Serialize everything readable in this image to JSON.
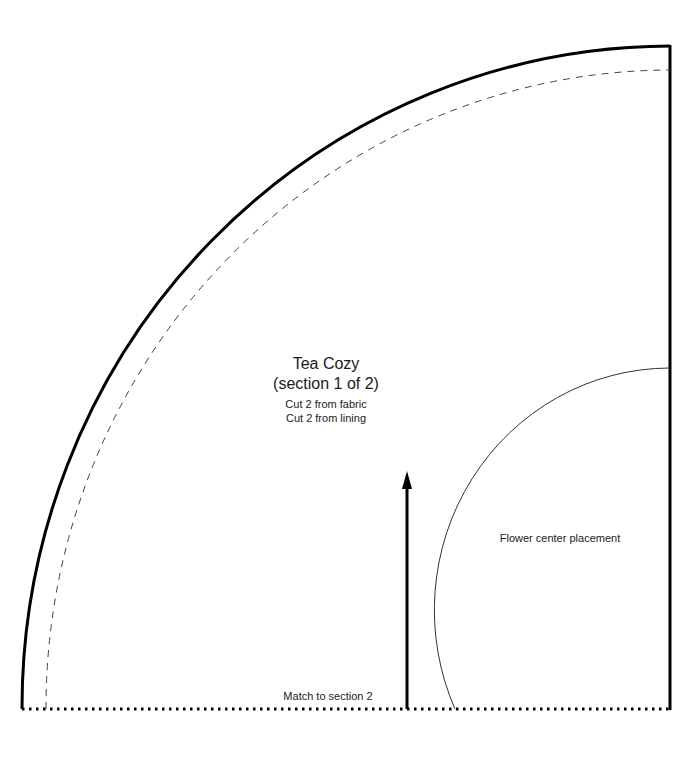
{
  "pattern": {
    "title": "Tea Cozy",
    "subtitle": "(section 1 of 2)",
    "instructions": [
      "Cut 2 from fabric",
      "Cut 2 from lining"
    ],
    "placement_label": "Flower center placement",
    "edge_label": "Match to section 2"
  },
  "colors": {
    "ink": "#000000",
    "paper": "#ffffff",
    "text": "#1a1a1a"
  }
}
